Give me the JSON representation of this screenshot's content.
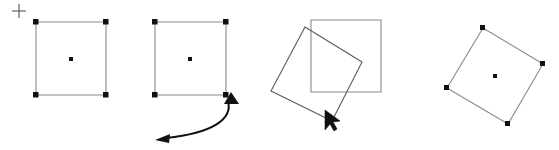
{
  "canvas": {
    "width": 559,
    "height": 150,
    "background_color": "#ffffff",
    "outline_color": "#8a8a8a",
    "handle_color": "#111111",
    "arrow_color": "#111111"
  },
  "diagram": {
    "panel_count": 4
  },
  "panels": [
    {
      "id": "panel-1",
      "name": "selected-square-initial",
      "caption": "",
      "shapes": [
        {
          "name": "square-upright-selected",
          "type": "polygon",
          "points": "36,22 106,22 106,95 36,95",
          "stroke": "#8a8a8a",
          "handles": [
            [
              36,
              22
            ],
            [
              106,
              22
            ],
            [
              106,
              95
            ],
            [
              36,
              95
            ]
          ],
          "center": [
            71,
            59
          ]
        }
      ],
      "markers": [
        {
          "name": "crosshair-origin-marker",
          "x": 19,
          "y": 11,
          "arm": 7
        }
      ]
    },
    {
      "id": "panel-2",
      "name": "square-with-rotation-arrow",
      "caption": "",
      "shapes": [
        {
          "name": "square-upright-selected",
          "type": "polygon",
          "points": "155,22 226,22 226,95 155,95",
          "stroke": "#8a8a8a",
          "handles": [
            [
              155,
              22
            ],
            [
              226,
              22
            ],
            [
              226,
              95
            ],
            [
              155,
              95
            ]
          ],
          "center": [
            190,
            59
          ]
        }
      ],
      "arrows": [
        {
          "name": "rotation-curved-arrow",
          "path": "M 228,100 C 232,118 214,133 163,138",
          "head_start": [
            232,
            95
          ],
          "head_end": [
            155,
            139
          ],
          "double_headed": true
        }
      ]
    },
    {
      "id": "panel-3",
      "name": "square-rotating-overlap",
      "caption": "",
      "shapes": [
        {
          "name": "square-upright-original",
          "type": "polygon",
          "points": "311,20 381,20 381,92 311,92",
          "stroke": "#8a8a8a",
          "handles": [],
          "center": null
        },
        {
          "name": "square-rotated-preview",
          "type": "polygon",
          "points": "305,27 362,62 332,121 271,91",
          "stroke": "#5a5a5a",
          "handles": [],
          "center": null
        }
      ],
      "markers": [
        {
          "name": "mouse-cursor-pointer",
          "x": 328,
          "y": 114
        }
      ]
    },
    {
      "id": "panel-4",
      "name": "square-rotated-final-selected",
      "caption": "",
      "shapes": [
        {
          "name": "square-rotated-selected",
          "type": "polygon",
          "points": "483,28 543,64 508,124 447,88",
          "stroke": "#8a8a8a",
          "handles": [
            [
              483,
              28
            ],
            [
              543,
              64
            ],
            [
              508,
              124
            ],
            [
              447,
              88
            ]
          ],
          "center": [
            495,
            76
          ]
        }
      ]
    }
  ]
}
